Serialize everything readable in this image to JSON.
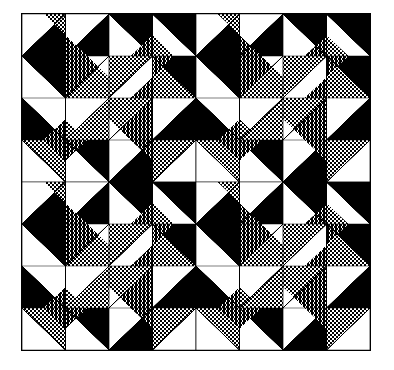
{
  "figure": {
    "width": 394,
    "height": 370,
    "background_color": "#ffffff",
    "frame": {
      "x": 21,
      "y": 13,
      "width": 350,
      "height": 338,
      "border_color": "#000000",
      "border_width": 1
    }
  },
  "palette": {
    "white": "#ffffff",
    "black": "#000000",
    "light_gray": "#b8b8b8",
    "dark_gray": "#6e6e6e",
    "outline": "#000000"
  },
  "pattern": {
    "type": "half-square-triangle-quilt",
    "tiling": {
      "blocks_x": 2,
      "blocks_y": 2
    },
    "block": {
      "cells_x": 4,
      "cells_y": 4
    },
    "symmetry": "180-degree rotational pinwheel",
    "seam_line_color": "#000000",
    "seam_line_width": 0.9,
    "legend": [
      {
        "swatch": "white",
        "label": "white"
      },
      {
        "swatch": "light_gray",
        "label": "light gray halftone"
      },
      {
        "swatch": "dark_gray",
        "label": "dark gray halftone"
      },
      {
        "swatch": "black",
        "label": "black"
      }
    ],
    "cells": [
      {
        "r": 0,
        "c": 0,
        "split": "tlbr",
        "a": "white",
        "b": "black",
        "sub": "tr",
        "subcolor": "light_gray"
      },
      {
        "r": 0,
        "c": 1,
        "split": "tlbr",
        "a": "white",
        "b": "black",
        "sub": "bl",
        "subcolor": "dark_gray"
      },
      {
        "r": 0,
        "c": 2,
        "split": "trbl",
        "a": "black",
        "b": "white",
        "sub": "br",
        "subcolor": "dark_gray"
      },
      {
        "r": 0,
        "c": 3,
        "split": "trbl",
        "a": "black",
        "b": "white",
        "sub": "bl",
        "subcolor": "light_gray"
      },
      {
        "r": 1,
        "c": 0,
        "split": "trbl",
        "a": "black",
        "b": "white",
        "sub": "none",
        "subcolor": "light_gray"
      },
      {
        "r": 1,
        "c": 1,
        "split": "tlbr",
        "a": "dark_gray",
        "b": "light_gray",
        "sub": "tr",
        "subcolor": "white"
      },
      {
        "r": 1,
        "c": 2,
        "split": "tlbr",
        "a": "light_gray",
        "b": "white",
        "sub": "br",
        "subcolor": "dark_gray"
      },
      {
        "r": 1,
        "c": 3,
        "split": "trbl",
        "a": "black",
        "b": "light_gray",
        "sub": "tl",
        "subcolor": "dark_gray"
      },
      {
        "r": 2,
        "c": 0,
        "split": "trbl",
        "a": "white",
        "b": "black",
        "sub": "br",
        "subcolor": "dark_gray"
      },
      {
        "r": 2,
        "c": 1,
        "split": "tlbr",
        "a": "white",
        "b": "light_gray",
        "sub": "bl",
        "subcolor": "light_gray"
      },
      {
        "r": 2,
        "c": 2,
        "split": "tlbr",
        "a": "light_gray",
        "b": "dark_gray",
        "sub": "bl",
        "subcolor": "white"
      },
      {
        "r": 2,
        "c": 3,
        "split": "tlbr",
        "a": "white",
        "b": "black",
        "sub": "none",
        "subcolor": "light_gray"
      },
      {
        "r": 3,
        "c": 0,
        "split": "trbl",
        "a": "light_gray",
        "b": "white",
        "sub": "tr",
        "subcolor": "dark_gray"
      },
      {
        "r": 3,
        "c": 1,
        "split": "trbl",
        "a": "black",
        "b": "white",
        "sub": "tl",
        "subcolor": "dark_gray"
      },
      {
        "r": 3,
        "c": 2,
        "split": "tlbr",
        "a": "white",
        "b": "black",
        "sub": "tr",
        "subcolor": "dark_gray"
      },
      {
        "r": 3,
        "c": 3,
        "split": "tlbr",
        "a": "light_gray",
        "b": "white",
        "sub": "tl",
        "subcolor": "light_gray"
      }
    ]
  }
}
